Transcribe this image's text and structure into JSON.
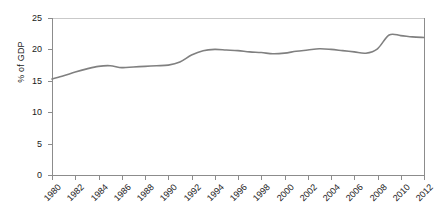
{
  "chart_data": {
    "type": "line",
    "title": "",
    "subtitle": "",
    "xlabel": "",
    "ylabel": "% of GDP",
    "xlim": [
      1980,
      2012
    ],
    "ylim": [
      0,
      25
    ],
    "grid": false,
    "legend": "none",
    "line_color": "#808080",
    "axis_color": "#8c8c8c",
    "y_ticks": [
      0,
      5,
      10,
      15,
      20,
      25
    ],
    "x_ticks": [
      1980,
      1982,
      1984,
      1986,
      1988,
      1990,
      1992,
      1994,
      1996,
      1998,
      2000,
      2002,
      2004,
      2006,
      2008,
      2010,
      2012
    ],
    "x": [
      1980,
      1981,
      1982,
      1983,
      1984,
      1985,
      1986,
      1987,
      1988,
      1989,
      1990,
      1991,
      1992,
      1993,
      1994,
      1995,
      1996,
      1997,
      1998,
      1999,
      2000,
      2001,
      2002,
      2003,
      2004,
      2005,
      2006,
      2007,
      2008,
      2009,
      2010,
      2011,
      2012
    ],
    "values": [
      15.3,
      15.8,
      16.4,
      16.9,
      17.3,
      17.4,
      17.1,
      17.2,
      17.3,
      17.4,
      17.5,
      18.0,
      19.1,
      19.8,
      20.0,
      19.9,
      19.8,
      19.6,
      19.5,
      19.3,
      19.4,
      19.7,
      19.9,
      20.1,
      20.0,
      19.8,
      19.6,
      19.4,
      20.1,
      22.3,
      22.2,
      22.0,
      21.9
    ],
    "series": [
      {
        "name": "% of GDP",
        "values": [
          15.3,
          15.8,
          16.4,
          16.9,
          17.3,
          17.4,
          17.1,
          17.2,
          17.3,
          17.4,
          17.5,
          18.0,
          19.1,
          19.8,
          20.0,
          19.9,
          19.8,
          19.6,
          19.5,
          19.3,
          19.4,
          19.7,
          19.9,
          20.1,
          20.0,
          19.8,
          19.6,
          19.4,
          20.1,
          22.3,
          22.2,
          22.0,
          21.9
        ]
      }
    ]
  }
}
